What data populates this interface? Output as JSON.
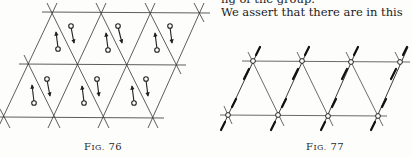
{
  "page": {
    "text_lines": [
      "ng of the group.",
      "We assert that there are in this"
    ]
  },
  "figures": [
    {
      "id": "fig-76",
      "caption_prefix": "F",
      "caption_smallcaps": "IG.",
      "caption_number": "76",
      "description": "Triangular lattice (parallelogram of 12 triangles) with a pair of arrows in each upward-pointing triangle; each pair: one arrow pointing up with circle at tail, one pointing down with circle at tail",
      "rows": 2,
      "columns": 3
    },
    {
      "id": "fig-77",
      "caption_prefix": "F",
      "caption_smallcaps": "IG.",
      "caption_number": "77",
      "description": "Triangular lattice strip with small circles at lattice nodes and double-headed arrows along the slanted lines through each node",
      "rows": 1,
      "columns": 4
    }
  ]
}
